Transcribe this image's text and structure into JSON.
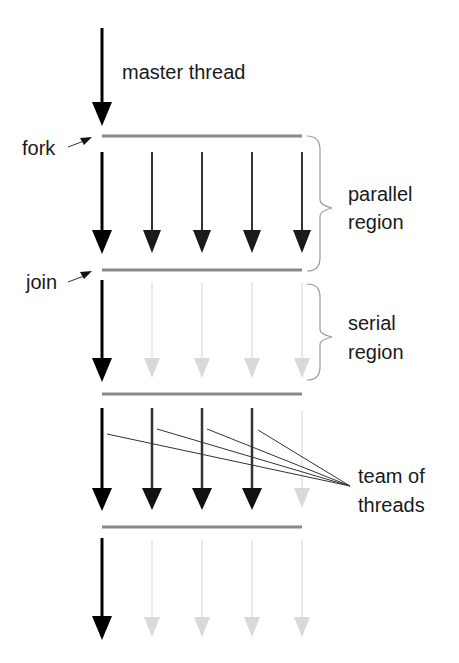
{
  "diagram": {
    "type": "fork-join thread model",
    "labels": {
      "master_thread": "master thread",
      "fork": "fork",
      "join": "join",
      "parallel_region_1": "parallel",
      "parallel_region_2": "region",
      "serial_region_1": "serial",
      "serial_region_2": "region",
      "team_1": "team of",
      "team_2": "threads"
    },
    "colors": {
      "master": "#000000",
      "active_thread": "#2a2a2a",
      "inactive_thread": "#d9d9d9",
      "bar": "#888888",
      "brace": "#999999",
      "pointer": "#333333"
    },
    "columns_x": [
      102,
      152,
      202,
      252,
      302
    ],
    "regions": [
      {
        "name": "master",
        "active_threads": 1
      },
      {
        "name": "parallel region",
        "active_threads": 5
      },
      {
        "name": "serial region",
        "active_threads": 1
      },
      {
        "name": "parallel (team of threads)",
        "active_threads": 4
      },
      {
        "name": "serial",
        "active_threads": 1
      }
    ]
  }
}
